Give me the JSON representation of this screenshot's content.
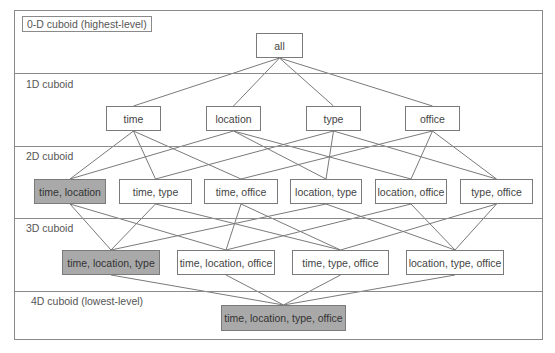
{
  "diagram": {
    "highlight_color": "#a9a9a9",
    "line_color": "#7a7a7a",
    "levels": [
      {
        "id": "L0",
        "label": "0-D cuboid (highest-level)"
      },
      {
        "id": "L1",
        "label": "1D cuboid"
      },
      {
        "id": "L2",
        "label": "2D cuboid"
      },
      {
        "id": "L3",
        "label": "3D cuboid"
      },
      {
        "id": "L4",
        "label": "4D cuboid (lowest-level)"
      }
    ],
    "nodes": {
      "all": {
        "label": "all",
        "highlighted": false
      },
      "time": {
        "label": "time",
        "highlighted": false
      },
      "location": {
        "label": "location",
        "highlighted": false
      },
      "type": {
        "label": "type",
        "highlighted": false
      },
      "office": {
        "label": "office",
        "highlighted": false
      },
      "time_location": {
        "label": "time, location",
        "highlighted": true
      },
      "time_type": {
        "label": "time, type",
        "highlighted": false
      },
      "time_office": {
        "label": "time, office",
        "highlighted": false
      },
      "location_type": {
        "label": "location, type",
        "highlighted": false
      },
      "location_office": {
        "label": "location, office",
        "highlighted": false
      },
      "type_office": {
        "label": "type, office",
        "highlighted": false
      },
      "time_location_type": {
        "label": "time, location, type",
        "highlighted": true
      },
      "time_location_office": {
        "label": "time, location, office",
        "highlighted": false
      },
      "time_type_office": {
        "label": "time, type, office",
        "highlighted": false
      },
      "location_type_office": {
        "label": "location, type, office",
        "highlighted": false
      },
      "time_location_type_office": {
        "label": "time, location, type, office",
        "highlighted": true
      }
    },
    "edges": [
      [
        "all",
        "time"
      ],
      [
        "all",
        "location"
      ],
      [
        "all",
        "type"
      ],
      [
        "all",
        "office"
      ],
      [
        "time",
        "time_location"
      ],
      [
        "time",
        "time_type"
      ],
      [
        "time",
        "time_office"
      ],
      [
        "location",
        "time_location"
      ],
      [
        "location",
        "location_type"
      ],
      [
        "location",
        "location_office"
      ],
      [
        "type",
        "time_type"
      ],
      [
        "type",
        "location_type"
      ],
      [
        "type",
        "type_office"
      ],
      [
        "office",
        "time_office"
      ],
      [
        "office",
        "location_office"
      ],
      [
        "office",
        "type_office"
      ],
      [
        "time_location",
        "time_location_type"
      ],
      [
        "time_location",
        "time_location_office"
      ],
      [
        "time_type",
        "time_location_type"
      ],
      [
        "time_type",
        "time_type_office"
      ],
      [
        "time_office",
        "time_location_office"
      ],
      [
        "time_office",
        "time_type_office"
      ],
      [
        "location_type",
        "time_location_type"
      ],
      [
        "location_type",
        "location_type_office"
      ],
      [
        "location_office",
        "time_location_office"
      ],
      [
        "location_office",
        "location_type_office"
      ],
      [
        "type_office",
        "time_type_office"
      ],
      [
        "type_office",
        "location_type_office"
      ],
      [
        "time_location_type",
        "time_location_type_office"
      ],
      [
        "time_location_office",
        "time_location_type_office"
      ],
      [
        "time_type_office",
        "time_location_type_office"
      ],
      [
        "location_type_office",
        "time_location_type_office"
      ]
    ]
  }
}
